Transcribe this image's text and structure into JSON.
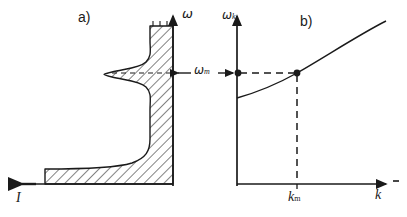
{
  "figure": {
    "kind": "two-panel scientific line figure",
    "background_color": "#ffffff",
    "ink_color": "#1a1a1a",
    "width": 407,
    "height": 217
  },
  "panel_a": {
    "label": "a)",
    "vertical_axis_label": "ω",
    "horizontal_axis_label": "I",
    "horizontal_axis_direction": "leftward-arrow",
    "vertical_axis_direction": "upward-arrow",
    "fill_style": "diagonal-hatching",
    "description_of_curve": "intensity profile with narrow resonance peak near ωm and broad low-frequency wing",
    "axis": {
      "x": 173,
      "y_baseline": 184,
      "y_top": 26
    },
    "peak": {
      "omega_y": 73,
      "min_x": 104
    },
    "baseline_left_x": 45,
    "top_cut_left_x": 150
  },
  "panel_b": {
    "label": "b)",
    "vertical_axis_label": "ω",
    "vertical_axis_subscript": "k",
    "horizontal_axis_label": "k",
    "horizontal_tick_label": "k",
    "horizontal_tick_subscript": "m",
    "axis": {
      "x_origin": 237,
      "y_baseline": 184,
      "y_top": 20,
      "x_end": 388
    },
    "marker_on_axis": {
      "x": 238,
      "y": 73
    },
    "marker_on_curve": {
      "x": 297,
      "y": 73
    },
    "curve_start": {
      "x": 237,
      "y": 98
    },
    "curve_end": {
      "x": 385,
      "y": 22
    },
    "dashed_guides": [
      "horizontal from axis to curve point",
      "vertical from curve point to k-axis"
    ],
    "description_of_curve": "monotonically increasing dispersion curve ωk(k), concave up"
  },
  "connector": {
    "label": "ω",
    "subscript": "m",
    "style": "double-headed horizontal arrow between panel a and panel b",
    "y": 73,
    "x_start": 176,
    "x_end": 236
  }
}
